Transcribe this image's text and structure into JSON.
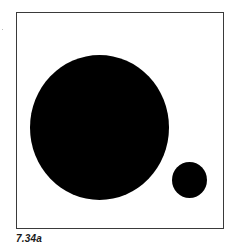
{
  "figure": {
    "caption": "7.34a",
    "frame": {
      "border_color": "#3a3a3a",
      "background": "#ffffff"
    },
    "shapes": [
      {
        "type": "circle",
        "name": "large-circle",
        "fill": "#000000",
        "center": [
          99,
          127
        ],
        "radius": 70
      },
      {
        "type": "circle",
        "name": "small-circle",
        "fill": "#000000",
        "center": [
          189,
          180
        ],
        "radius": 18
      }
    ]
  }
}
